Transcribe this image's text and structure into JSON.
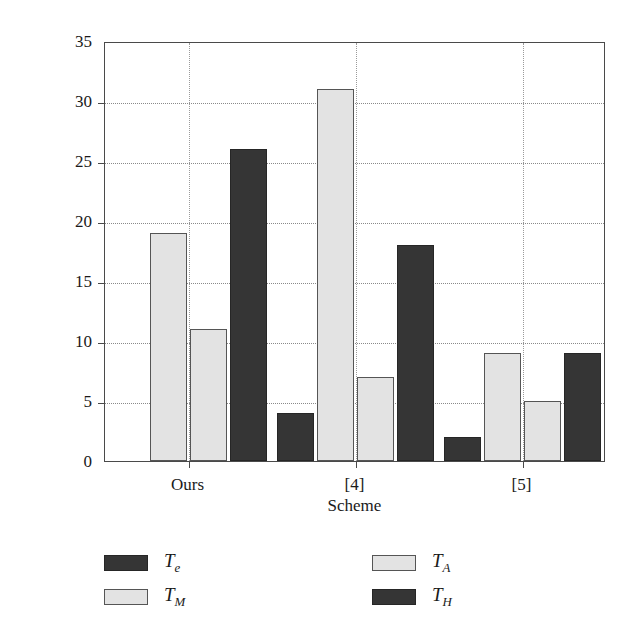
{
  "chart_data": {
    "type": "bar",
    "title": "",
    "xlabel": "Scheme",
    "ylabel": "Computational cost",
    "categories": [
      "Ours",
      "[4]",
      "[5]"
    ],
    "series": [
      {
        "name": "Te",
        "label": "T",
        "sub": "e",
        "color": "#353535",
        "style": "dark",
        "values": [
          0,
          4,
          2
        ]
      },
      {
        "name": "TM",
        "label": "T",
        "sub": "M",
        "color": "#e3e3e3",
        "style": "light",
        "values": [
          19,
          31,
          9
        ]
      },
      {
        "name": "TA",
        "label": "T",
        "sub": "A",
        "color": "#e3e3e3",
        "style": "light",
        "values": [
          11,
          7,
          5
        ]
      },
      {
        "name": "TH",
        "label": "T",
        "sub": "H",
        "color": "#353535",
        "style": "dark",
        "values": [
          26,
          18,
          9
        ]
      }
    ],
    "ylim": [
      0,
      35
    ],
    "yticks": [
      0,
      5,
      10,
      15,
      20,
      25,
      30,
      35
    ],
    "ytick_labels": [
      "0",
      "5",
      "10",
      "15",
      "20",
      "25",
      "30",
      "35"
    ],
    "grid": true,
    "grid_style": "dotted",
    "legend_position": "below",
    "legend": [
      {
        "label": "T",
        "sub": "e",
        "style": "dark",
        "col": 0,
        "row": 0
      },
      {
        "label": "T",
        "sub": "M",
        "style": "light",
        "col": 0,
        "row": 1
      },
      {
        "label": "T",
        "sub": "A",
        "style": "light",
        "col": 1,
        "row": 0
      },
      {
        "label": "T",
        "sub": "H",
        "style": "dark",
        "col": 1,
        "row": 1
      }
    ]
  },
  "axis": {
    "ylabel_text": "Computational cost",
    "xlabel_text": "Scheme"
  }
}
